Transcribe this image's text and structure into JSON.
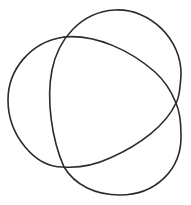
{
  "figure": {
    "type": "trefoil-knot",
    "stroke_color": "#2b2b2b",
    "background_color": "#ffffff",
    "lobes": [
      "upper-right",
      "left",
      "lower-right"
    ],
    "crossings": [
      {
        "name": "top-left",
        "x": 64,
        "y": 37
      },
      {
        "name": "right",
        "x": 176,
        "y": 103
      },
      {
        "name": "bottom-left",
        "x": 64,
        "y": 167
      }
    ]
  }
}
